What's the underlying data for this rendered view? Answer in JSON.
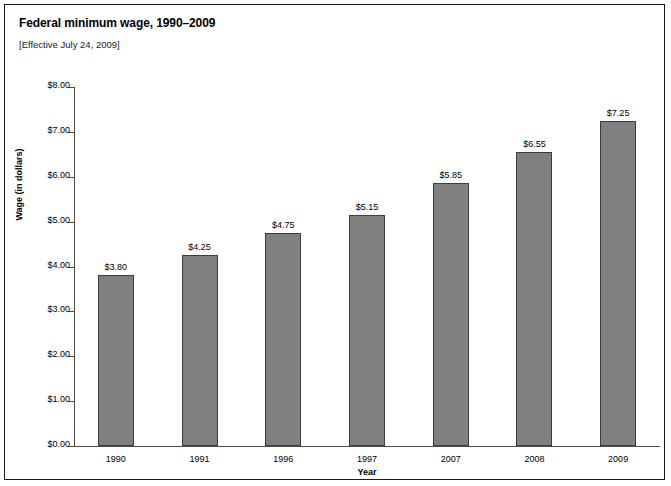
{
  "figure": {
    "title": "Federal minimum wage, 1990–2009",
    "subtitle": "[Effective July 24, 2009]"
  },
  "colors": {
    "bar_fill": "#808080",
    "bar_border": "#3d3d3d",
    "axis": "#4d4d4d",
    "frame": "#1a1a1a",
    "text": "#000000",
    "background": "#ffffff"
  },
  "chart_data": {
    "type": "bar",
    "title": "Federal minimum wage, 1990–2009",
    "subtitle": "[Effective July 24, 2009]",
    "xlabel": "Year",
    "ylabel": "Wage (in dollars)",
    "categories": [
      "1990",
      "1991",
      "1996",
      "1997",
      "2007",
      "2008",
      "2009"
    ],
    "values": [
      3.8,
      4.25,
      4.75,
      5.15,
      5.85,
      6.55,
      7.25
    ],
    "value_labels": [
      "$3.80",
      "$4.25",
      "$4.75",
      "$5.15",
      "$5.85",
      "$6.55",
      "$7.25"
    ],
    "ylim": [
      0,
      8
    ],
    "ytick_values": [
      0,
      1,
      2,
      3,
      4,
      5,
      6,
      7,
      8
    ],
    "ytick_labels": [
      "$0.00",
      "$1.00",
      "$2.00",
      "$3.00",
      "$4.00",
      "$5.00",
      "$6.00",
      "$7.00",
      "$8.00"
    ],
    "grid": false,
    "legend": false
  }
}
